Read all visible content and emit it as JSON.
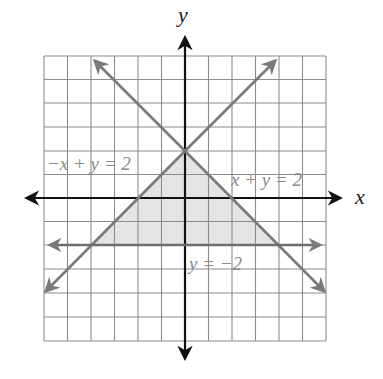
{
  "figure": {
    "axis_labels": {
      "x": "x",
      "y": "y"
    },
    "grid": {
      "xmin": -6,
      "xmax": 6,
      "ymin": -6,
      "ymax": 6,
      "step": 1
    },
    "lines": [
      {
        "id": "line1",
        "equation": "−x + y = 2",
        "label": "−x + y = 2"
      },
      {
        "id": "line2",
        "equation": "x + y = 2",
        "label": "x + y = 2"
      },
      {
        "id": "line3",
        "equation": "y = −2",
        "label": "y = −2"
      }
    ],
    "shaded_region": {
      "description": "Triangle bounded by −x + y ≤ 2, x + y ≤ 2, y ≥ −2",
      "vertices": [
        [
          0,
          2
        ],
        [
          -4,
          -2
        ],
        [
          4,
          -2
        ]
      ]
    },
    "colors": {
      "grid": "#8c8c8c",
      "axes": "#111111",
      "boundary_lines": "#7a7a7a",
      "shade": "#e4e4e4",
      "label_text": "#8a8a8a"
    }
  }
}
